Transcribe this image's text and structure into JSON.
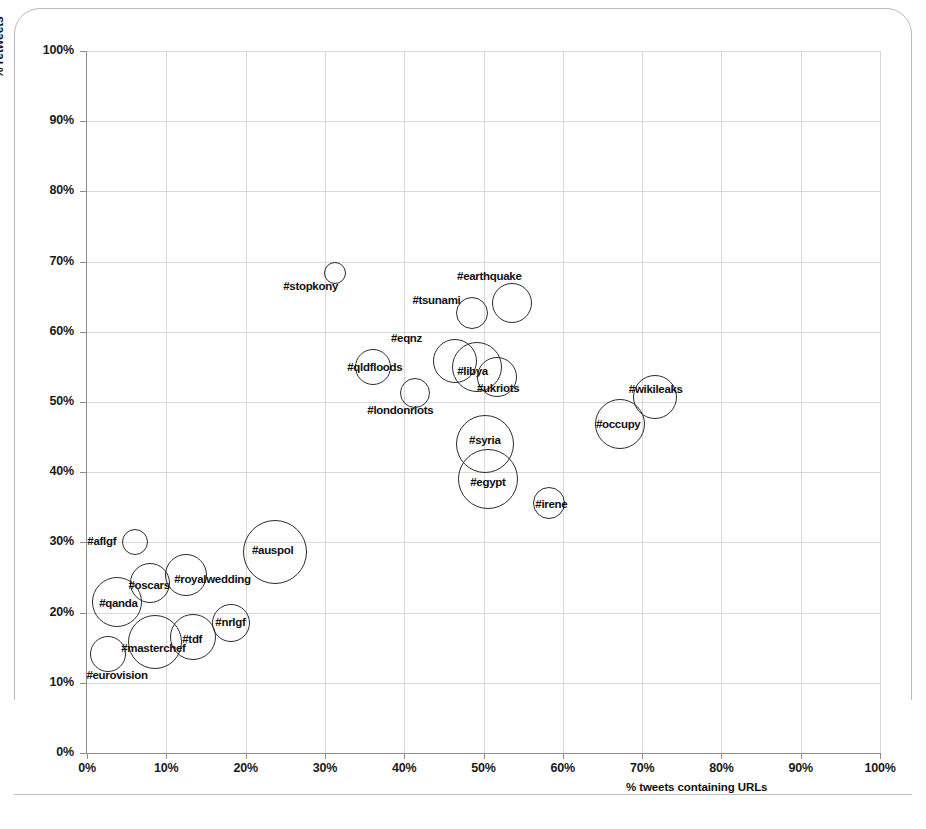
{
  "chart_data": {
    "type": "scatter",
    "title": "",
    "xlabel": "% tweets containing URLs",
    "ylabel": "% retweets",
    "xlim": [
      0,
      100
    ],
    "ylim": [
      0,
      100
    ],
    "grid": true,
    "legend": "none",
    "x_ticks": [
      "0%",
      "10%",
      "20%",
      "30%",
      "40%",
      "50%",
      "60%",
      "70%",
      "80%",
      "90%",
      "100%"
    ],
    "y_ticks": [
      "0%",
      "10%",
      "20%",
      "30%",
      "40%",
      "50%",
      "60%",
      "70%",
      "80%",
      "90%",
      "100%"
    ],
    "x_tick_values": [
      0,
      10,
      20,
      30,
      40,
      50,
      60,
      70,
      80,
      90,
      100
    ],
    "y_tick_values": [
      0,
      10,
      20,
      30,
      40,
      50,
      60,
      70,
      80,
      90,
      100
    ],
    "bubble_outline_color": "#2b2b2b",
    "bubble_fill": "none",
    "points": [
      {
        "label": "#stopkony",
        "x": 31.3,
        "y": 68.4,
        "r": 11,
        "lx": -52,
        "ly": 14
      },
      {
        "label": "#earthquake",
        "x": 53.6,
        "y": 64.1,
        "r": 20,
        "lx": -55,
        "ly": -26
      },
      {
        "label": "#tsunami",
        "x": 48.6,
        "y": 62.7,
        "r": 16,
        "lx": -60,
        "ly": -12
      },
      {
        "label": "#eqnz",
        "x": 46.4,
        "y": 55.8,
        "r": 22,
        "lx": -64,
        "ly": -22
      },
      {
        "label": "#libya",
        "x": 49.2,
        "y": 55.0,
        "r": 25,
        "lx": -20,
        "ly": 5
      },
      {
        "label": "#ukriots",
        "x": 51.7,
        "y": 53.6,
        "r": 20,
        "lx": -20,
        "ly": 12
      },
      {
        "label": "#qldfloods",
        "x": 36.1,
        "y": 55.0,
        "r": 18,
        "lx": -26,
        "ly": 1
      },
      {
        "label": "#londonriots",
        "x": 41.4,
        "y": 51.3,
        "r": 15,
        "lx": -48,
        "ly": 18
      },
      {
        "label": "#wikileaks",
        "x": 71.6,
        "y": 50.7,
        "r": 22,
        "lx": -26,
        "ly": -7
      },
      {
        "label": "#occupy",
        "x": 67.2,
        "y": 46.9,
        "r": 25,
        "lx": -24,
        "ly": 1
      },
      {
        "label": "#syria",
        "x": 50.2,
        "y": 44.0,
        "r": 29,
        "lx": -16,
        "ly": -3
      },
      {
        "label": "#egypt",
        "x": 50.6,
        "y": 39.0,
        "r": 30,
        "lx": -18,
        "ly": 4
      },
      {
        "label": "#irene",
        "x": 58.3,
        "y": 35.6,
        "r": 16,
        "lx": -14,
        "ly": 2
      },
      {
        "label": "#aflgf",
        "x": 6.1,
        "y": 30.0,
        "r": 13,
        "lx": -48,
        "ly": 0
      },
      {
        "label": "#auspol",
        "x": 23.7,
        "y": 28.6,
        "r": 32,
        "lx": -23,
        "ly": -1
      },
      {
        "label": "#oscars",
        "x": 8.0,
        "y": 24.2,
        "r": 20,
        "lx": -22,
        "ly": 3
      },
      {
        "label": "#royalwedding",
        "x": 12.5,
        "y": 25.4,
        "r": 21,
        "lx": -12,
        "ly": 5
      },
      {
        "label": "#qanda",
        "x": 3.8,
        "y": 21.5,
        "r": 25,
        "lx": -18,
        "ly": 2
      },
      {
        "label": "#nrlgf",
        "x": 18.2,
        "y": 18.5,
        "r": 19,
        "lx": -16,
        "ly": 0
      },
      {
        "label": "#tdf",
        "x": 13.4,
        "y": 16.5,
        "r": 23,
        "lx": -11,
        "ly": 3
      },
      {
        "label": "#masterchef",
        "x": 8.6,
        "y": 15.8,
        "r": 27,
        "lx": -34,
        "ly": 7
      },
      {
        "label": "#eurovision",
        "x": 2.7,
        "y": 14.1,
        "r": 18,
        "lx": -22,
        "ly": 22
      }
    ]
  }
}
